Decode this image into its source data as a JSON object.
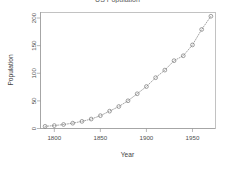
{
  "chart_data": {
    "type": "line",
    "title": "US Population",
    "xlabel": "Year",
    "ylabel": "Population",
    "x": [
      1790,
      1800,
      1810,
      1820,
      1830,
      1840,
      1850,
      1860,
      1870,
      1880,
      1890,
      1900,
      1910,
      1920,
      1930,
      1940,
      1950,
      1960,
      1970
    ],
    "values": [
      3.93,
      5.31,
      7.24,
      9.64,
      12.9,
      17.1,
      23.2,
      31.4,
      39.8,
      50.2,
      62.9,
      76.0,
      92.0,
      105.7,
      122.8,
      131.7,
      151.3,
      179.3,
      203.2
    ],
    "series": [
      {
        "name": "Population",
        "values": [
          3.93,
          5.31,
          7.24,
          9.64,
          12.9,
          17.1,
          23.2,
          31.4,
          39.8,
          50.2,
          62.9,
          76.0,
          92.0,
          105.7,
          122.8,
          131.7,
          151.3,
          179.3,
          203.2
        ]
      }
    ],
    "xlim": [
      1785,
      1975
    ],
    "ylim": [
      0,
      210
    ],
    "xticks": [
      1800,
      1850,
      1900,
      1950
    ],
    "yticks": [
      0,
      50,
      100,
      150,
      200
    ],
    "xtick_labels": [
      "1800",
      "1850",
      "1900",
      "1950"
    ],
    "ytick_labels": [
      "0",
      "50",
      "100",
      "150",
      "200"
    ],
    "grid": false,
    "legend": false,
    "marker": "open-circle",
    "line_style": "dotted",
    "series_color": "#6f6f6f",
    "axis_color": "#9a9a9a",
    "background": "#ffffff"
  }
}
